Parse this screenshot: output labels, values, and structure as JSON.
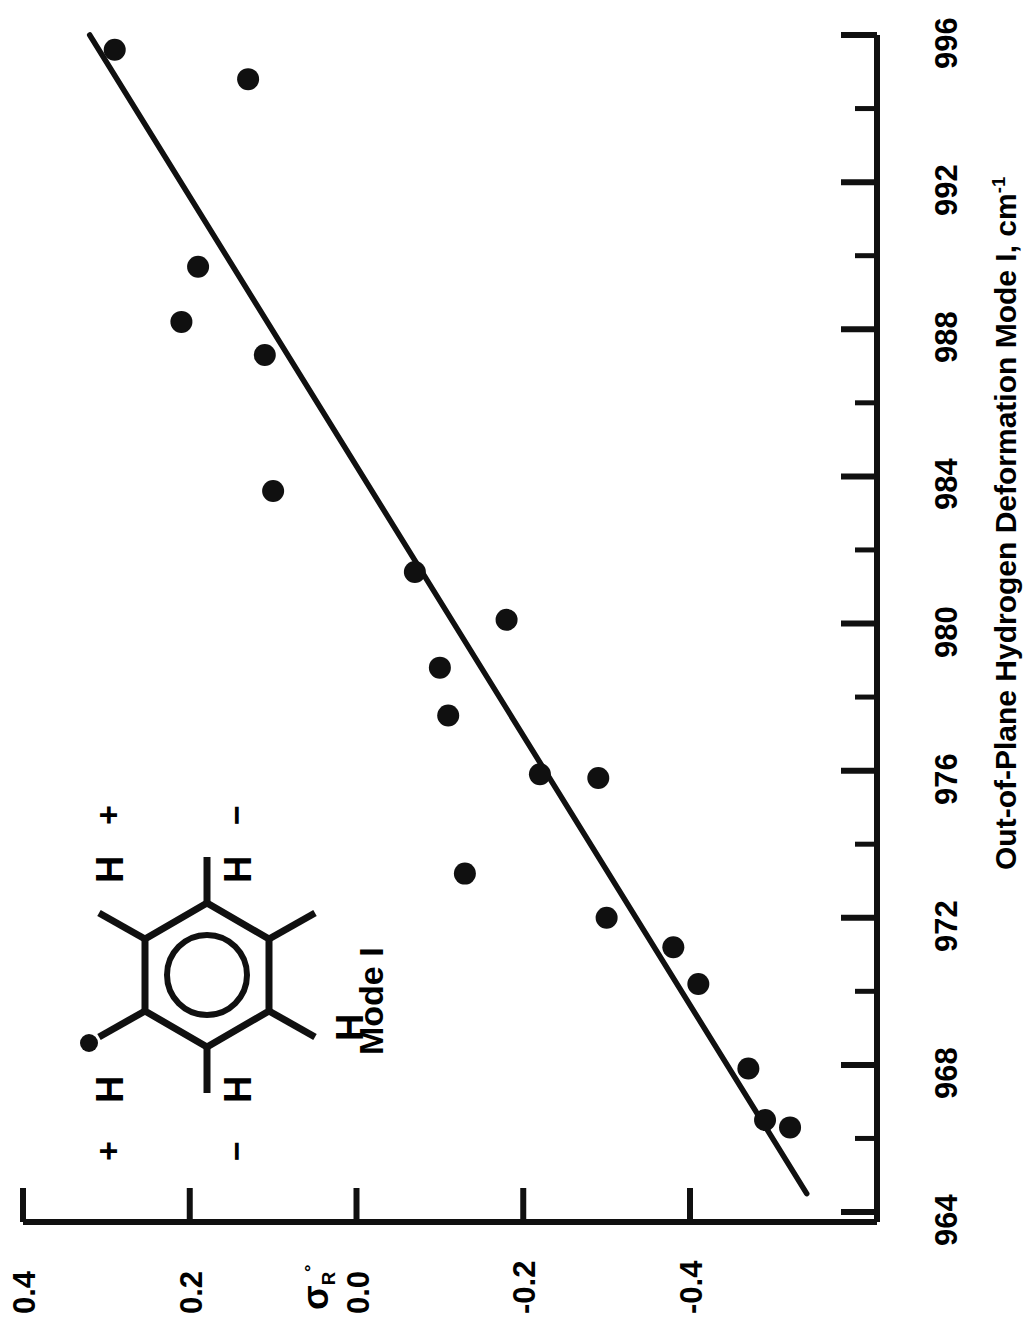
{
  "chart_data": {
    "type": "scatter",
    "title": "",
    "orientation": "rotated-90-ccw",
    "xlabel": "Out-of-Plane Hydrogen Deformation Mode I, cm-1",
    "xlabel_parts": {
      "main": "Out-of-Plane Hydrogen Deformation Mode I, cm",
      "superscript": "-1"
    },
    "ylabel": "σR°",
    "ylabel_parts": {
      "main": "σ",
      "subscript": "R",
      "superscript": "°"
    },
    "xlim": [
      964,
      996
    ],
    "ylim": [
      -0.5,
      0.4
    ],
    "x_major_ticks": [
      964,
      968,
      972,
      976,
      980,
      984,
      988,
      992,
      996
    ],
    "x_tick_labels": [
      "964",
      "968",
      "972",
      "976",
      "980",
      "984",
      "988",
      "992",
      "996"
    ],
    "x_minor_ticks": [
      966,
      970,
      974,
      978,
      982,
      986,
      990,
      994
    ],
    "y_major_ticks": [
      0.4,
      0.2,
      0.0,
      -0.2,
      -0.4
    ],
    "y_tick_labels": [
      "0.4",
      "0.2",
      "0.0",
      "-0.2",
      "-0.4"
    ],
    "grid": false,
    "legend": "none",
    "points": [
      {
        "x": 995.6,
        "y": 0.29
      },
      {
        "x": 994.8,
        "y": 0.13
      },
      {
        "x": 989.7,
        "y": 0.19
      },
      {
        "x": 988.2,
        "y": 0.21
      },
      {
        "x": 987.3,
        "y": 0.11
      },
      {
        "x": 983.6,
        "y": 0.1
      },
      {
        "x": 981.4,
        "y": -0.07
      },
      {
        "x": 980.1,
        "y": -0.18
      },
      {
        "x": 978.8,
        "y": -0.1
      },
      {
        "x": 977.5,
        "y": -0.11
      },
      {
        "x": 975.9,
        "y": -0.22
      },
      {
        "x": 975.8,
        "y": -0.29
      },
      {
        "x": 973.2,
        "y": -0.13
      },
      {
        "x": 972.0,
        "y": -0.3
      },
      {
        "x": 971.2,
        "y": -0.38
      },
      {
        "x": 970.2,
        "y": -0.41
      },
      {
        "x": 967.9,
        "y": -0.47
      },
      {
        "x": 966.5,
        "y": -0.49
      },
      {
        "x": 966.3,
        "y": -0.52
      }
    ],
    "fit_line": {
      "x1": 996.0,
      "y1": 0.32,
      "x2": 964.5,
      "y2": -0.54,
      "label": "linear fit"
    },
    "marker": {
      "shape": "filled-circle",
      "color": "#101010",
      "size_px": 22
    },
    "line_color": "#101010",
    "axis_color": "#101010",
    "background": "#ffffff"
  },
  "annotations": {
    "mode_label": "Mode I",
    "molecule": {
      "name": "substituted-benzene-ring",
      "hydrogens": [
        {
          "position": "ortho-top",
          "label": "H",
          "sign": "+"
        },
        {
          "position": "meta-top",
          "label": "H",
          "sign": "−"
        },
        {
          "position": "para",
          "label": "H",
          "sign": ""
        },
        {
          "position": "meta-bottom",
          "label": "H",
          "sign": "−"
        },
        {
          "position": "ortho-bottom",
          "label": "H",
          "sign": "+"
        }
      ],
      "substituent_marker": "filled-dot"
    }
  }
}
